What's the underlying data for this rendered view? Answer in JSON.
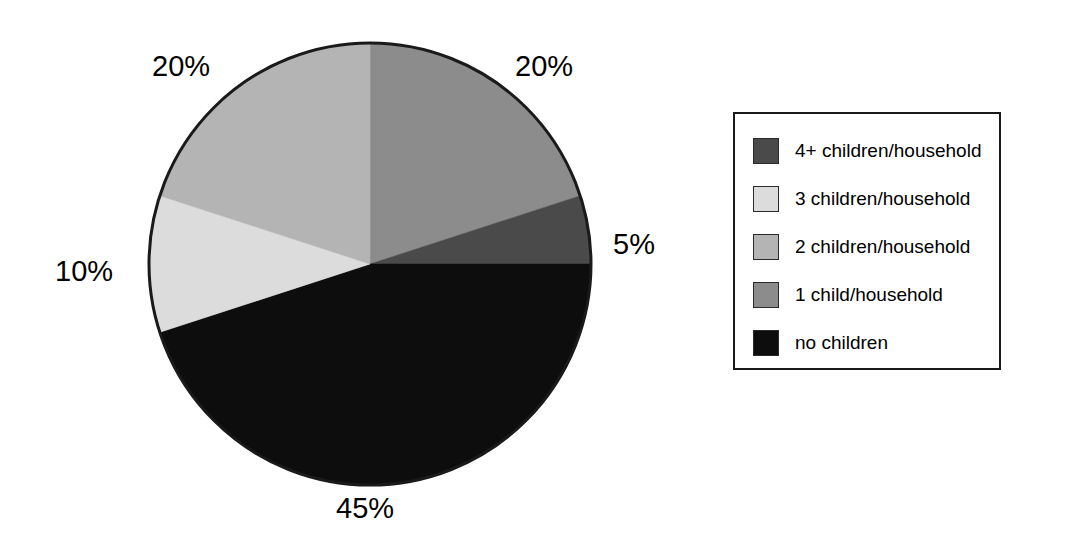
{
  "chart_data": {
    "type": "pie",
    "title": "",
    "categories": [
      "1 child/household",
      "4+ children/household",
      "no children",
      "3 children/household",
      "2 children/household"
    ],
    "values": [
      20,
      5,
      45,
      10,
      20
    ],
    "value_labels": [
      "20%",
      "5%",
      "45%",
      "10%",
      "20%"
    ],
    "colors": [
      "#8c8c8c",
      "#4a4a4a",
      "#0d0d0d",
      "#dcdcdc",
      "#b4b4b4"
    ],
    "start_angle_deg": 0,
    "direction": "clockwise",
    "legend_position": "right",
    "grid": false,
    "outline_color": "#1a1a1a"
  },
  "labels": {
    "top_left": "20%",
    "top_right": "20%",
    "right": "5%",
    "left": "10%",
    "bottom": "45%"
  },
  "legend": {
    "items": [
      {
        "label": "4+ children/household",
        "color": "#4a4a4a",
        "swatch_name": "legend-swatch-4plus"
      },
      {
        "label": "3 children/household",
        "color": "#dcdcdc",
        "swatch_name": "legend-swatch-3"
      },
      {
        "label": "2 children/household",
        "color": "#b4b4b4",
        "swatch_name": "legend-swatch-2"
      },
      {
        "label": "1 child/household",
        "color": "#8c8c8c",
        "swatch_name": "legend-swatch-1"
      },
      {
        "label": "no children",
        "color": "#0d0d0d",
        "swatch_name": "legend-swatch-none"
      }
    ]
  }
}
